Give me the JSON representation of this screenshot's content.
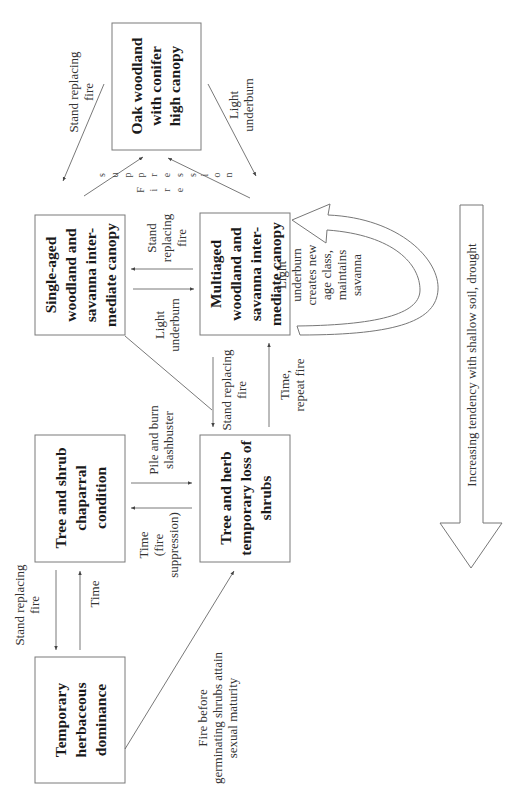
{
  "diagram": {
    "orientation": "rotated 90 degrees counter-clockwise",
    "states": {
      "oak": {
        "lines": [
          "Oak woodland",
          "with conifer",
          "high canopy"
        ]
      },
      "single_aged": {
        "lines": [
          "Single-aged",
          "woodland and",
          "savanna inter-",
          "mediate canopy"
        ]
      },
      "multiaged": {
        "lines": [
          "Multiaged",
          "woodland and",
          "savanna inter-",
          "mediate canopy"
        ]
      },
      "tree_shrub": {
        "lines": [
          "Tree and shrub",
          "chaparral",
          "condition"
        ]
      },
      "tree_herb": {
        "lines": [
          "Tree and herb",
          "temporary loss of",
          "shrubs"
        ]
      },
      "herbaceous": {
        "lines": [
          "Temporary",
          "herbaceous",
          "dominance"
        ]
      }
    },
    "transitions": {
      "oak_stand_replacing": {
        "lines": [
          "Stand replacing",
          "fire"
        ]
      },
      "oak_light_underburn": {
        "lines": [
          "Light",
          "underburn"
        ]
      },
      "fire_suppression": {
        "col1": [
          "F",
          "i",
          "r",
          "e"
        ],
        "col2": [
          "s",
          "u",
          "p",
          "p",
          "r",
          "e",
          "s",
          "s",
          "i",
          "o",
          "n"
        ]
      },
      "single_multi_stand": {
        "lines": [
          "Stand",
          "replacing",
          "fire"
        ]
      },
      "single_multi_light": {
        "lines": [
          "Light",
          "underburn"
        ]
      },
      "multi_loop": {
        "lines": [
          "Light",
          "underburn",
          "creates new",
          "age class,",
          "maintains",
          "savanna"
        ]
      },
      "multi_herb_stand": {
        "lines": [
          "Stand replacing",
          "fire"
        ]
      },
      "herb_multi_time": {
        "lines": [
          "Time,",
          "repeat fire"
        ]
      },
      "shrub_herb_pile": {
        "lines": [
          "Pile and burn",
          "slashbuster"
        ]
      },
      "herb_shrub_time": {
        "lines": [
          "Time",
          "(fire",
          "suppression)"
        ]
      },
      "shrub_herbaceous_stand": {
        "lines": [
          "Stand replacing",
          "fire"
        ]
      },
      "herbaceous_shrub_time": {
        "lines": [
          "Time"
        ]
      },
      "herbaceous_herb_fire": {
        "lines": [
          "Fire before",
          "germinating shrubs attain",
          "sexual maturity"
        ]
      }
    },
    "gradient_arrow": {
      "label": "Increasing tendency with shallow soil, drought"
    }
  }
}
